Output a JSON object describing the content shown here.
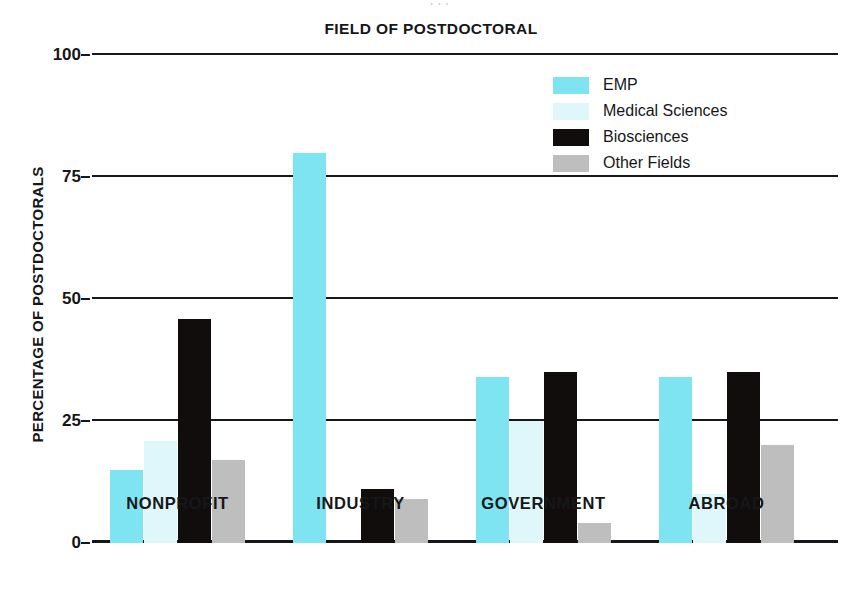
{
  "bleed_artifact": "· · ·",
  "chart_data": {
    "type": "bar",
    "title": "FIELD OF POSTDOCTORAL",
    "xlabel": "",
    "ylabel": "PERCENTAGE OF POSTDOCTORALS",
    "ylim": [
      0,
      100
    ],
    "yticks": [
      0,
      25,
      50,
      75,
      100
    ],
    "ytick_labels": [
      "0",
      "25",
      "50",
      "75",
      "100"
    ],
    "grid": true,
    "legend_position": "top-right",
    "categories": [
      "NONPROFIT",
      "INDUSTRY",
      "GOVERNMENT",
      "ABROAD"
    ],
    "series": [
      {
        "name": "EMP",
        "color": "#7FE4F2",
        "values": [
          15,
          80,
          34,
          34
        ]
      },
      {
        "name": "Medical Sciences",
        "color": "#DFF7FB",
        "values": [
          21,
          0,
          25,
          10
        ]
      },
      {
        "name": "Biosciences",
        "color": "#100D0C",
        "values": [
          46,
          11,
          35,
          35
        ]
      },
      {
        "name": "Other Fields",
        "color": "#BEBEBE",
        "values": [
          17,
          9,
          4,
          20
        ]
      }
    ]
  }
}
